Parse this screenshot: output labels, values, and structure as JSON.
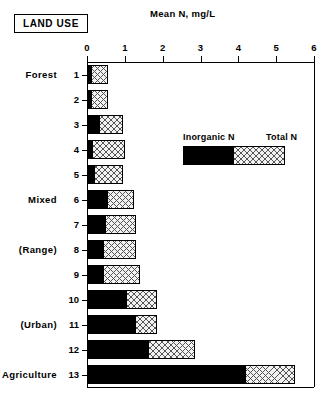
{
  "badge": {
    "label": "LAND USE"
  },
  "title": "Mean N, mg/L",
  "legend": {
    "inorganic_label": "Inorganic N",
    "total_label": "Total N"
  },
  "axis": {
    "ticks": [
      "0",
      "1",
      "2",
      "3",
      "4",
      "5",
      "6"
    ]
  },
  "categories": {
    "forest": "Forest",
    "mixed": "Mixed",
    "range": "(Range)",
    "urban": "(Urban)",
    "agriculture": "Agriculture"
  },
  "rows": [
    {
      "num": "1",
      "cat": "Forest",
      "inorganic": 0.13,
      "total": 0.55
    },
    {
      "num": "2",
      "cat": "",
      "inorganic": 0.13,
      "total": 0.55
    },
    {
      "num": "3",
      "cat": "",
      "inorganic": 0.35,
      "total": 0.95
    },
    {
      "num": "4",
      "cat": "",
      "inorganic": 0.17,
      "total": 1.0
    },
    {
      "num": "5",
      "cat": "",
      "inorganic": 0.2,
      "total": 0.95
    },
    {
      "num": "6",
      "cat": "Mixed",
      "inorganic": 0.55,
      "total": 1.25
    },
    {
      "num": "7",
      "cat": "",
      "inorganic": 0.5,
      "total": 1.3
    },
    {
      "num": "8",
      "cat": "(Range)",
      "inorganic": 0.45,
      "total": 1.3
    },
    {
      "num": "9",
      "cat": "",
      "inorganic": 0.45,
      "total": 1.4
    },
    {
      "num": "10",
      "cat": "",
      "inorganic": 1.05,
      "total": 1.85
    },
    {
      "num": "11",
      "cat": "(Urban)",
      "inorganic": 1.3,
      "total": 1.85
    },
    {
      "num": "12",
      "cat": "",
      "inorganic": 1.65,
      "total": 2.85
    },
    {
      "num": "13",
      "cat": "Agriculture",
      "inorganic": 4.2,
      "total": 5.5
    }
  ],
  "colors": {
    "inorganic": "#000000",
    "total_fill": "#f2f2f2",
    "total_hatch": "#555555",
    "axis": "#000000"
  },
  "chart_data": {
    "type": "bar",
    "orientation": "horizontal",
    "stacked": true,
    "title": "Mean N, mg/L",
    "xlabel": "Mean N, mg/L",
    "ylabel": "LAND USE",
    "xlim": [
      0,
      6
    ],
    "xticks": [
      0,
      1,
      2,
      3,
      4,
      5,
      6
    ],
    "grid": false,
    "legend_position": "inside-upper-right",
    "categories": [
      "1",
      "2",
      "3",
      "4",
      "5",
      "6",
      "7",
      "8",
      "9",
      "10",
      "11",
      "12",
      "13"
    ],
    "category_groups": [
      {
        "label": "Forest",
        "rows": [
          "1",
          "2",
          "3",
          "4",
          "5"
        ]
      },
      {
        "label": "Mixed",
        "rows": [
          "6",
          "7"
        ]
      },
      {
        "label": "(Range)",
        "rows": [
          "8",
          "9"
        ]
      },
      {
        "label": "(Urban)",
        "rows": [
          "10",
          "11",
          "12"
        ]
      },
      {
        "label": "Agriculture",
        "rows": [
          "13"
        ]
      }
    ],
    "series": [
      {
        "name": "Inorganic N",
        "values": [
          0.13,
          0.13,
          0.35,
          0.17,
          0.2,
          0.55,
          0.5,
          0.45,
          0.45,
          1.05,
          1.3,
          1.65,
          4.2
        ]
      },
      {
        "name": "Total N",
        "values": [
          0.55,
          0.55,
          0.95,
          1.0,
          0.95,
          1.25,
          1.3,
          1.3,
          1.4,
          1.85,
          1.85,
          2.85,
          5.5
        ]
      }
    ]
  }
}
